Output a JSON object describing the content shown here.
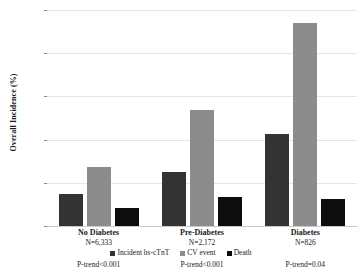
{
  "chart_data": {
    "type": "bar",
    "title": "",
    "xlabel": "",
    "ylabel": "Overall Incidence (%)",
    "ylim": [
      0,
      25
    ],
    "ytick_labels": [
      "25%",
      "20%",
      "15%",
      "10%",
      "5%",
      "0%"
    ],
    "ytick_values": [
      25,
      20,
      15,
      10,
      5,
      0
    ],
    "grid": true,
    "legend_position": "bottom",
    "categories": [
      "No Diabetes",
      "Pre-Diabetes",
      "Diabetes"
    ],
    "category_sublabels": [
      "N=6,333",
      "N=2,172",
      "N=826"
    ],
    "series": [
      {
        "name": "Incident hs-cTnT",
        "color": "#333333",
        "values": [
          3.7,
          6.2,
          10.6
        ]
      },
      {
        "name": "CV event",
        "color": "#8c8c8c",
        "values": [
          6.8,
          13.4,
          23.5
        ]
      },
      {
        "name": "Death",
        "color": "#0d0d0d",
        "values": [
          2.1,
          3.4,
          3.1
        ]
      }
    ],
    "annotations": [
      "P-trend<0.001",
      "P-trend<0.001",
      "P-trend=0.04"
    ]
  }
}
